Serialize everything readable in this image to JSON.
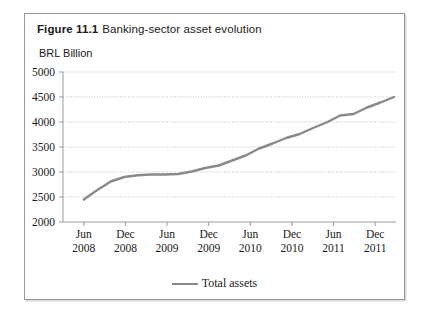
{
  "figure": {
    "number": "Figure 11.1",
    "title": "Banking-sector asset evolution",
    "unit_label": "BRL Billion"
  },
  "legend": {
    "series_label": "Total assets",
    "swatch_color": "#8a8a8a"
  },
  "chart_data": {
    "type": "line",
    "title": "Banking-sector asset evolution",
    "xlabel": "",
    "ylabel": "BRL Billion",
    "ylim": [
      2000,
      5000
    ],
    "ytick_labels": [
      "5000",
      "4500",
      "4000",
      "3500",
      "3000",
      "2500",
      "2000"
    ],
    "ytick_values": [
      5000,
      4500,
      4000,
      3500,
      3000,
      2500,
      2000
    ],
    "xtick_labels": [
      {
        "month": "Jun",
        "year": "2008"
      },
      {
        "month": "Dec",
        "year": "2008"
      },
      {
        "month": "Jun",
        "year": "2009"
      },
      {
        "month": "Dec",
        "year": "2009"
      },
      {
        "month": "Jun",
        "year": "2010"
      },
      {
        "month": "Dec",
        "year": "2010"
      },
      {
        "month": "Jun",
        "year": "2011"
      },
      {
        "month": "Dec",
        "year": "2011"
      }
    ],
    "grid": true,
    "legend_position": "bottom-center",
    "line_color": "#8a8a8a",
    "series": [
      {
        "name": "Total assets",
        "x": [
          "Jun 2008",
          "Aug 2008",
          "Oct 2008",
          "Dec 2008",
          "Feb 2009",
          "Apr 2009",
          "Jun 2009",
          "Aug 2009",
          "Oct 2009",
          "Dec 2009",
          "Feb 2010",
          "Apr 2010",
          "Jun 2010",
          "Aug 2010",
          "Oct 2010",
          "Dec 2010",
          "Feb 2011",
          "Apr 2011",
          "Jun 2011",
          "Aug 2011",
          "Oct 2011",
          "Dec 2011",
          "Feb 2012",
          "Apr 2012"
        ],
        "values": [
          2450,
          2640,
          2810,
          2900,
          2935,
          2950,
          2950,
          2960,
          3010,
          3080,
          3130,
          3230,
          3330,
          3470,
          3570,
          3680,
          3760,
          3880,
          3990,
          4130,
          4160,
          4290,
          4390,
          4500
        ]
      }
    ]
  }
}
